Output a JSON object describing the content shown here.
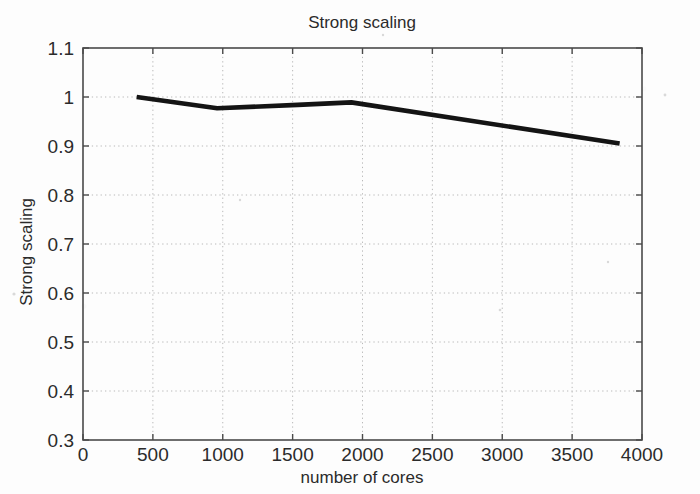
{
  "chart_data": {
    "type": "line",
    "title": "Strong scaling",
    "xlabel": "number of cores",
    "ylabel": "Strong scaling",
    "xlim": [
      0,
      4000
    ],
    "ylim": [
      0.3,
      1.1
    ],
    "xticks": [
      0,
      500,
      1000,
      1500,
      2000,
      2500,
      3000,
      3500,
      4000
    ],
    "xtick_labels": [
      "0",
      "500",
      "1000",
      "1500",
      "2000",
      "2500",
      "3000",
      "3500",
      "4000"
    ],
    "yticks": [
      0.3,
      0.4,
      0.5,
      0.6,
      0.7,
      0.8,
      0.9,
      1.0,
      1.1
    ],
    "ytick_labels": [
      "0.3",
      "0.4",
      "0.5",
      "0.6",
      "0.7",
      "0.8",
      "0.9",
      "1",
      "1.1"
    ],
    "grid": true,
    "grid_style": "dotted",
    "grid_color": "#b9b9b9",
    "legend": null,
    "series": [
      {
        "name": "Strong scaling",
        "color": "#141414",
        "line_width": 4.6,
        "x": [
          384,
          960,
          1536,
          1920,
          3840
        ],
        "values": [
          1.0,
          0.977,
          0.984,
          0.989,
          0.905
        ]
      }
    ]
  },
  "figure": {
    "title": "Strong scaling",
    "x_axis_title": "number of cores",
    "y_axis_title": "Strong scaling",
    "x_tick_labels": [
      "0",
      "500",
      "1000",
      "1500",
      "2000",
      "2500",
      "3000",
      "3500",
      "4000"
    ],
    "y_tick_labels": [
      "0.3",
      "0.4",
      "0.5",
      "0.6",
      "0.7",
      "0.8",
      "0.9",
      "1",
      "1.1"
    ]
  }
}
